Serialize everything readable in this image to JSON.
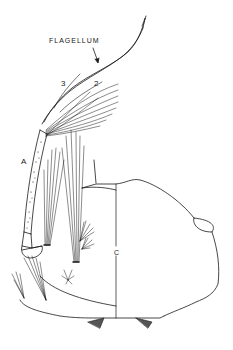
{
  "figure": {
    "type": "anatomical line drawing",
    "labels": {
      "flagellum": "FLAGELLUM",
      "segment_3": "3",
      "segment_2": "2",
      "part_a": "A",
      "part_c": "C"
    },
    "colors": {
      "ink": "#1a1a1a",
      "background": "#ffffff"
    }
  }
}
